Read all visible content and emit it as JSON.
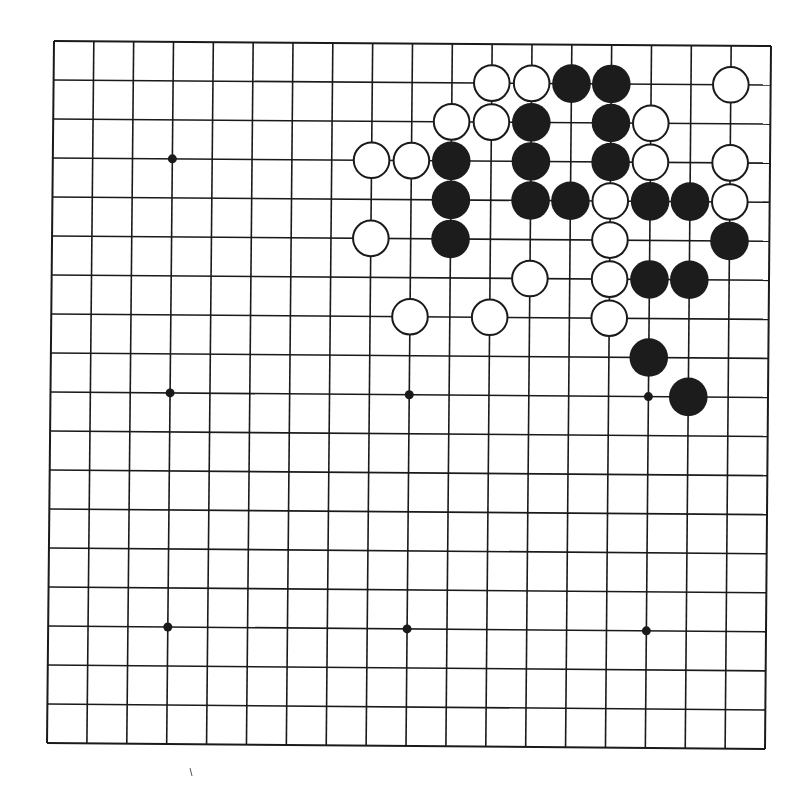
{
  "board": {
    "size": 19,
    "colors": {
      "background": "#ffffff",
      "line": "#1a1a1a",
      "black_stone": "#1c1c1c",
      "white_stone": "#ffffff",
      "stone_outline": "#1a1a1a"
    },
    "star_points": [
      [
        3,
        3
      ],
      [
        9,
        3
      ],
      [
        15,
        3
      ],
      [
        3,
        9
      ],
      [
        9,
        9
      ],
      [
        15,
        9
      ],
      [
        3,
        15
      ],
      [
        9,
        15
      ],
      [
        15,
        15
      ]
    ],
    "stones": [
      {
        "color": "white",
        "col": 11,
        "row": 1
      },
      {
        "color": "white",
        "col": 12,
        "row": 1
      },
      {
        "color": "black",
        "col": 13,
        "row": 1
      },
      {
        "color": "black",
        "col": 14,
        "row": 1
      },
      {
        "color": "white",
        "col": 17,
        "row": 1
      },
      {
        "color": "white",
        "col": 10,
        "row": 2
      },
      {
        "color": "white",
        "col": 11,
        "row": 2
      },
      {
        "color": "black",
        "col": 12,
        "row": 2
      },
      {
        "color": "black",
        "col": 14,
        "row": 2
      },
      {
        "color": "white",
        "col": 15,
        "row": 2
      },
      {
        "color": "white",
        "col": 8,
        "row": 3
      },
      {
        "color": "white",
        "col": 9,
        "row": 3
      },
      {
        "color": "black",
        "col": 10,
        "row": 3
      },
      {
        "color": "black",
        "col": 12,
        "row": 3
      },
      {
        "color": "black",
        "col": 14,
        "row": 3
      },
      {
        "color": "white",
        "col": 15,
        "row": 3
      },
      {
        "color": "white",
        "col": 17,
        "row": 3
      },
      {
        "color": "black",
        "col": 10,
        "row": 4
      },
      {
        "color": "black",
        "col": 12,
        "row": 4
      },
      {
        "color": "black",
        "col": 13,
        "row": 4
      },
      {
        "color": "white",
        "col": 14,
        "row": 4
      },
      {
        "color": "black",
        "col": 15,
        "row": 4
      },
      {
        "color": "black",
        "col": 16,
        "row": 4
      },
      {
        "color": "white",
        "col": 17,
        "row": 4
      },
      {
        "color": "white",
        "col": 8,
        "row": 5
      },
      {
        "color": "black",
        "col": 10,
        "row": 5
      },
      {
        "color": "white",
        "col": 14,
        "row": 5
      },
      {
        "color": "black",
        "col": 17,
        "row": 5
      },
      {
        "color": "white",
        "col": 12,
        "row": 6
      },
      {
        "color": "white",
        "col": 14,
        "row": 6
      },
      {
        "color": "black",
        "col": 15,
        "row": 6
      },
      {
        "color": "black",
        "col": 16,
        "row": 6
      },
      {
        "color": "white",
        "col": 9,
        "row": 7
      },
      {
        "color": "white",
        "col": 11,
        "row": 7
      },
      {
        "color": "white",
        "col": 14,
        "row": 7
      },
      {
        "color": "black",
        "col": 15,
        "row": 8
      },
      {
        "color": "black",
        "col": 16,
        "row": 9
      }
    ]
  }
}
